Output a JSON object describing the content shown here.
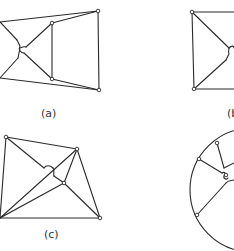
{
  "figure": {
    "panels": [
      {
        "id": "a",
        "label": "(a)",
        "label_pos": [
          41,
          117
        ],
        "vertices": [
          [
            98,
            11
          ],
          [
            52,
            23
          ],
          [
            52,
            79
          ],
          [
            99,
            90
          ]
        ],
        "edges": [
          [
            [
              0,
              22
            ],
            [
              98,
              11
            ]
          ],
          [
            [
              98,
              11
            ],
            [
              99,
              90
            ]
          ],
          [
            [
              0,
              78
            ],
            [
              99,
              90
            ]
          ],
          [
            [
              52,
              23
            ],
            [
              98,
              11
            ]
          ],
          [
            [
              52,
              79
            ],
            [
              99,
              90
            ]
          ],
          [
            [
              52,
              23
            ],
            [
              52,
              79
            ]
          ],
          [
            [
              0,
              22
            ],
            [
              17,
              40
            ]
          ],
          [
            [
              52,
              79
            ],
            [
              24,
              53
            ]
          ],
          [
            [
              52,
              23
            ],
            [
              26,
              47
            ]
          ],
          [
            [
              0,
              78
            ],
            [
              18,
              58
            ]
          ]
        ],
        "humps": [
          "M17,40 L20,46 C18,50 21,53 24,53",
          "M26,47 C23,46 21,48 20,48 L18,58"
        ]
      },
      {
        "id": "b",
        "label": "(b)",
        "label_pos": [
          227,
          117
        ],
        "vertices": [
          [
            192,
            12
          ],
          [
            194,
            89
          ]
        ],
        "edges": [
          [
            [
              192,
              12
            ],
            [
              234,
              12
            ]
          ],
          [
            [
              192,
              12
            ],
            [
              194,
              89
            ]
          ],
          [
            [
              194,
              89
            ],
            [
              234,
              89
            ]
          ],
          [
            [
              192,
              12
            ],
            [
              229,
              48
            ]
          ],
          [
            [
              194,
              89
            ],
            [
              226,
              60
            ]
          ]
        ],
        "humps": [
          "M229,48 C232,45 234,46 234,48",
          "M226,60 L229,54 C228,51 229,49 229,48"
        ]
      },
      {
        "id": "c",
        "label": "(c)",
        "label_pos": [
          44,
          238
        ],
        "vertices": [
          [
            6,
            137
          ],
          [
            77,
            149
          ],
          [
            64,
            183
          ],
          [
            100,
            218
          ]
        ],
        "edges": [
          [
            [
              6,
              137
            ],
            [
              77,
              149
            ]
          ],
          [
            [
              6,
              137
            ],
            [
              0,
              218
            ]
          ],
          [
            [
              0,
              218
            ],
            [
              100,
              218
            ]
          ],
          [
            [
              77,
              149
            ],
            [
              100,
              218
            ]
          ],
          [
            [
              77,
              149
            ],
            [
              64,
              183
            ]
          ],
          [
            [
              64,
              183
            ],
            [
              100,
              218
            ]
          ],
          [
            [
              6,
              137
            ],
            [
              44,
              168
            ]
          ],
          [
            [
              0,
              218
            ],
            [
              77,
              149
            ]
          ],
          [
            [
              0,
              218
            ],
            [
              64,
              183
            ]
          ],
          [
            [
              54,
              176
            ],
            [
              64,
              183
            ]
          ]
        ],
        "humps": [
          "M44,168 C46,165 50,165 53,168",
          "M53,168 C55,170 53,174 54,176"
        ]
      },
      {
        "id": "d",
        "label": "(d)",
        "circle": {
          "cx": 252,
          "cy": 190,
          "r": 62
        },
        "vertices": [
          [
            217,
            143
          ],
          [
            199,
            159
          ],
          [
            197,
            215
          ],
          [
            226,
            175
          ]
        ],
        "edges": [
          [
            [
              217,
              143
            ],
            [
              224,
              168
            ]
          ],
          [
            [
              199,
              159
            ],
            [
              222,
              173
            ]
          ],
          [
            [
              197,
              215
            ],
            [
              226,
              183
            ]
          ],
          [
            [
              224,
              168
            ],
            [
              234,
              163
            ]
          ]
        ],
        "humps": [
          "M222,173 C225,171 226,174 224,176 C223,179 227,180 228,178",
          "M226,183 C228,180 231,181 234,180"
        ]
      }
    ]
  }
}
